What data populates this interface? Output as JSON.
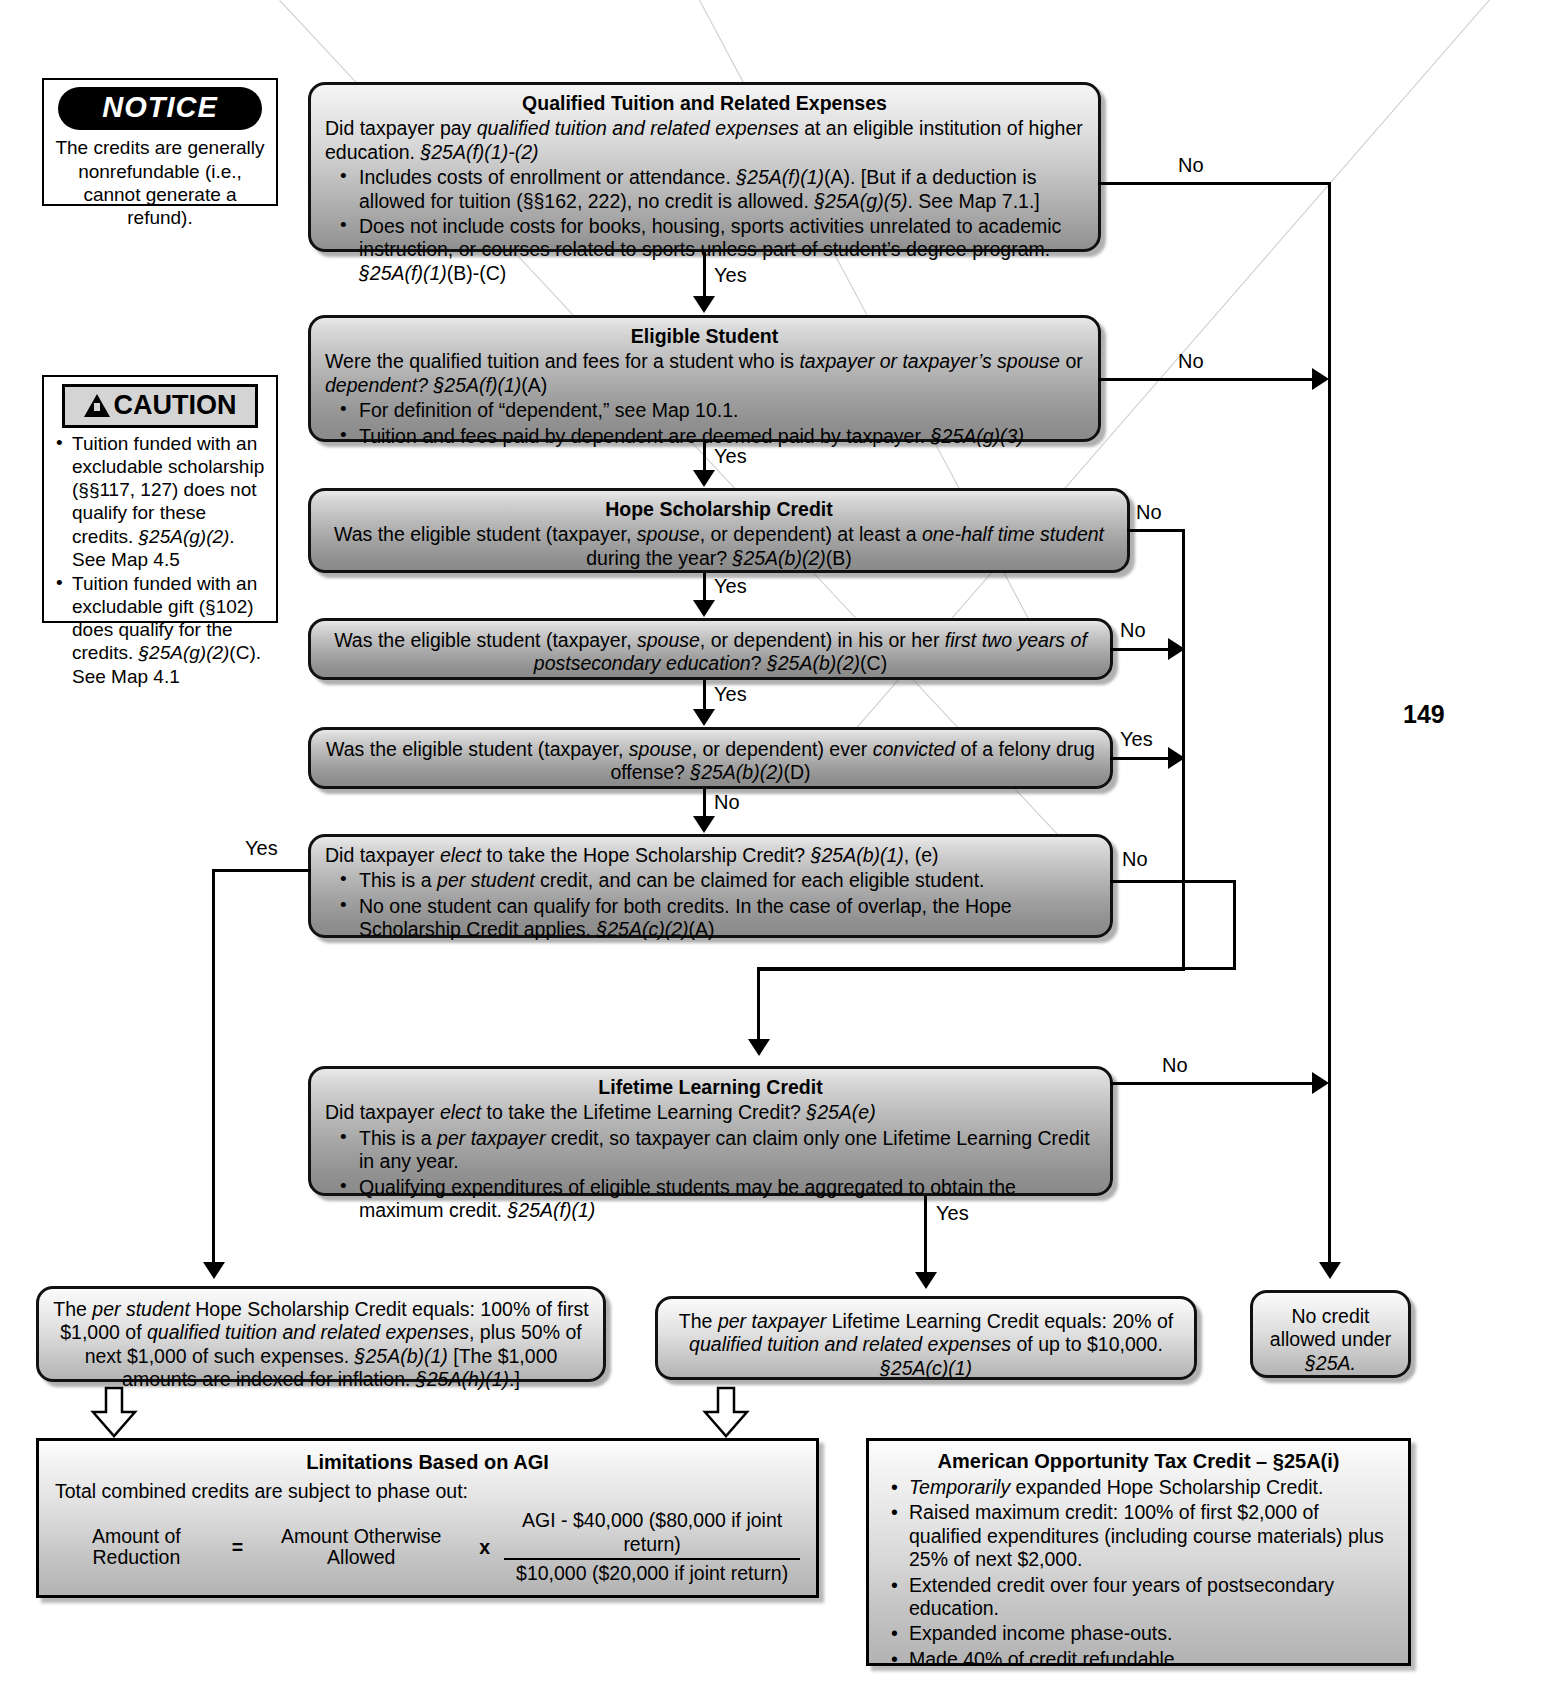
{
  "page": {
    "number": "149"
  },
  "notice": {
    "title": "NOTICE",
    "body": "The credits are generally nonrefundable (i.e., cannot generate a refund)."
  },
  "caution": {
    "title": "CAUTION",
    "items": [
      "Tuition funded with an excludable scholarship (§§117, 127) does not qualify for these credits.  §25A(g)(2). See Map 4.5",
      "Tuition funded with an excludable gift (§102) does qualify for the credits.  §25A(g)(2)(C). See Map 4.1"
    ]
  },
  "nodes": {
    "qtre": {
      "header": "Qualified Tuition and Related Expenses",
      "question": "Did taxpayer pay qualified tuition and related expenses at an eligible institution of higher education.  §25A(f)(1)-(2)",
      "bullets": [
        "Includes costs of enrollment or attendance.  §25A(f)(1)(A).  [But if a deduction is allowed for tuition (§§162, 222), no credit is allowed.  §25A(g)(5).  See Map 7.1.]",
        "Does not include costs for books, housing, sports activities unrelated to academic instruction, or courses related to sports unless part of student’s degree program.  §25A(f)(1)(B)-(C)"
      ]
    },
    "eligible_student": {
      "header": "Eligible Student",
      "question": "Were the qualified tuition and fees for a student who is taxpayer or taxpayer’s spouse or dependent?  §25A(f)(1)(A)",
      "bullets": [
        "For definition of “dependent,” see Map 10.1.",
        "Tuition and fees paid by dependent are deemed paid by taxpayer.  §25A(g)(3)"
      ]
    },
    "hope_credit": {
      "header": "Hope Scholarship Credit",
      "question": "Was the eligible student (taxpayer, spouse, or dependent) at least a one-half time student during the year?  §25A(b)(2)(B)"
    },
    "first_two_years": {
      "question": "Was the eligible student (taxpayer, spouse, or dependent) in his or her first two years of postsecondary education?  §25A(b)(2)(C)"
    },
    "felony": {
      "question": "Was the eligible student (taxpayer, spouse, or dependent) ever convicted of a felony drug offense?  §25A(b)(2)(D)"
    },
    "elect_hope": {
      "question": "Did taxpayer elect to take the Hope Scholarship Credit?  §25A(b)(1), (e)",
      "bullets": [
        "This is a per student credit, and can be claimed for each eligible student.",
        "No one student can qualify for both credits.  In the case of overlap, the Hope Scholarship Credit applies.  §25A(c)(2)(A)"
      ]
    },
    "llc": {
      "header": "Lifetime Learning Credit",
      "question": "Did taxpayer elect to take the Lifetime Learning Credit?  §25A(e)",
      "bullets": [
        "This is a per taxpayer credit, so taxpayer can claim only one Lifetime Learning Credit in any year.",
        "Qualifying expenditures of eligible students may be aggregated to obtain the maximum credit.  §25A(f)(1)"
      ]
    },
    "hope_result": {
      "text": "The per student Hope Scholarship Credit equals:  100% of first $1,000 of qualified tuition and related expenses, plus 50% of next $1,000 of such expenses.  §25A(b)(1)  [The $1,000 amounts are indexed for inflation.  §25A(h)(1).]"
    },
    "llc_result": {
      "text": "The per taxpayer Lifetime Learning Credit equals:  20% of qualified tuition and related expenses of up to $10,000.  §25A(c)(1)"
    },
    "no_credit": {
      "text": "No credit allowed under §25A."
    },
    "agi": {
      "header": "Limitations Based on AGI",
      "intro": "Total combined credits are subject to phase out:",
      "formula": {
        "left": "Amount of Reduction",
        "equals": "=",
        "middle": "Amount Otherwise Allowed",
        "times": "x",
        "numerator": "AGI - $40,000 ($80,000 if joint return)",
        "denominator": "$10,000 ($20,000 if joint return)"
      }
    },
    "aotc": {
      "header": "American Opportunity Tax Credit – §25A(i)",
      "bullets": [
        "Temporarily expanded Hope Scholarship Credit.",
        "Raised maximum credit:  100% of first $2,000 of qualified expenditures (including course materials) plus 25% of next $2,000.",
        "Extended credit over four years of postsecondary education.",
        "Expanded income phase-outs.",
        "Made 40% of credit refundable."
      ]
    }
  },
  "edges": {
    "yes_1": "Yes",
    "yes_2": "Yes",
    "yes_3": "Yes",
    "yes_4": "Yes",
    "yes_elect_hope": "Yes",
    "yes_llc": "Yes",
    "no_1": "No",
    "no_2": "No",
    "no_3": "No",
    "no_4": "No",
    "no_felony_down": "No",
    "yes_felony": "Yes",
    "no_elect_hope": "No",
    "no_llc": "No"
  }
}
